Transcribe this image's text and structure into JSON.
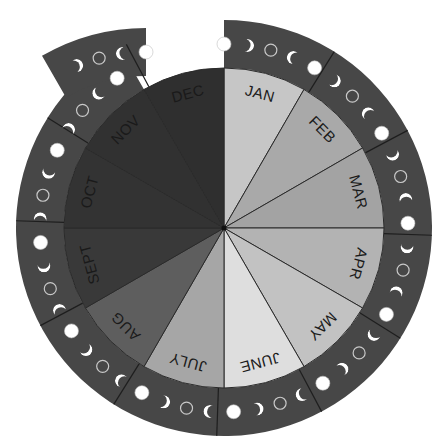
{
  "center": {
    "x": 224,
    "y": 228
  },
  "radii": {
    "pie": 160,
    "ring_inner": 160,
    "ring_outer": 208,
    "moon_track": 184
  },
  "colors": {
    "ring": "#474747",
    "ring_divider": "#1e1e1e",
    "slice_divider": "#2a2a2a",
    "moon_fill": "#ffffff",
    "new_moon_stroke": "#c9c9c9",
    "label": "#1a1a1a"
  },
  "months": [
    {
      "label": "JAN",
      "color": "#c6c6c6"
    },
    {
      "label": "FEB",
      "color": "#a9a9a9"
    },
    {
      "label": "MAR",
      "color": "#a3a3a3"
    },
    {
      "label": "APR",
      "color": "#b3b3b3"
    },
    {
      "label": "MAY",
      "color": "#c2c2c2"
    },
    {
      "label": "JUNE",
      "color": "#dedede"
    },
    {
      "label": "JULY",
      "color": "#a6a6a6"
    },
    {
      "label": "AUG",
      "color": "#5e5e5e"
    },
    {
      "label": "SEPT",
      "color": "#393939"
    },
    {
      "label": "OCT",
      "color": "#333333"
    },
    {
      "label": "NOV",
      "color": "#313131"
    },
    {
      "label": "DEC",
      "color": "#2f2f2f"
    }
  ],
  "moon_phase_sequence": [
    "full",
    "waning-crescent",
    "new",
    "waxing-crescent"
  ],
  "ring": {
    "start_angle_deg": 0,
    "end_angle_deg": 330,
    "moons_per_cycle": 4,
    "cycle_span_deg": 29.5
  },
  "dec_tab": {
    "start_angle_deg": 330,
    "end_angle_deg": 360,
    "offset": {
      "x": -78,
      "y": 8
    }
  }
}
